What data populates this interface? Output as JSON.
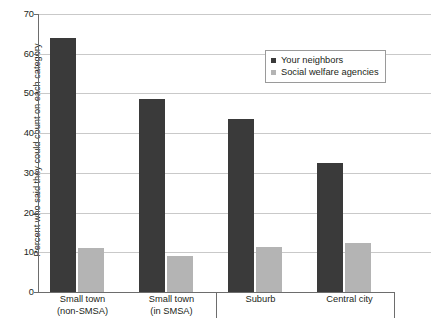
{
  "chart_data": {
    "type": "bar",
    "title": "",
    "xlabel": "",
    "ylabel": "Percent who said they could count on each category",
    "categories": [
      {
        "line1": "Small town",
        "line2": "(non-SMSA)"
      },
      {
        "line1": "Small town",
        "line2": "(in SMSA)"
      },
      {
        "line1": "Suburb",
        "line2": ""
      },
      {
        "line1": "Central city",
        "line2": ""
      }
    ],
    "series": [
      {
        "name": "Your neighbors",
        "color": "#3a3a3a",
        "values": [
          64,
          48.5,
          43.5,
          32.5
        ]
      },
      {
        "name": "Social welfare agencies",
        "color": "#b4b4b4",
        "values": [
          11,
          9,
          11.3,
          12.3
        ]
      }
    ],
    "ylim": [
      0,
      70
    ],
    "yticks": [
      0,
      10,
      20,
      30,
      40,
      50,
      60,
      70
    ],
    "ytick_labels": [
      "0",
      "10",
      "20",
      "30",
      "40",
      "50",
      "60",
      "70"
    ],
    "grid": true,
    "legend_position": "upper right"
  }
}
